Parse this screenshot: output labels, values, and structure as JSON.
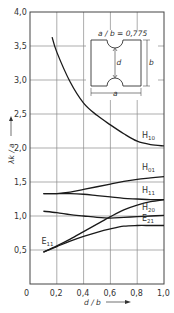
{
  "chart_data": {
    "type": "line",
    "title": "",
    "xlabel": "d / b",
    "ylabel": "λk / a",
    "xlim": [
      0,
      1.0
    ],
    "ylim": [
      0,
      4.0
    ],
    "grid": true,
    "x_ticks": [
      "0",
      "0,2",
      "0,4",
      "0,6",
      "0,8",
      "1,0"
    ],
    "y_ticks": [
      "0,5",
      "1,0",
      "1,5",
      "2,0",
      "2,5",
      "3,0",
      "3,5",
      "4,0"
    ],
    "y_zero_label": "0",
    "legend_position": "inline labels at right end of curves",
    "inset": {
      "label": "a / b = 0,775",
      "dim_width": "a",
      "dim_height": "b",
      "dim_gap": "d"
    },
    "series": [
      {
        "name": "H10",
        "label_main": "H",
        "label_sub": "10",
        "x": [
          0.165,
          0.2,
          0.3,
          0.4,
          0.5,
          0.6,
          0.7,
          0.8,
          0.9,
          1.0
        ],
        "y": [
          3.63,
          3.41,
          2.97,
          2.66,
          2.48,
          2.34,
          2.21,
          2.1,
          2.05,
          2.03
        ]
      },
      {
        "name": "H01",
        "label_main": "H",
        "label_sub": "01",
        "x": [
          0.1,
          0.2,
          0.3,
          0.4,
          0.5,
          0.6,
          0.7,
          0.8,
          0.9,
          1.0
        ],
        "y": [
          1.33,
          1.33,
          1.35,
          1.39,
          1.43,
          1.47,
          1.51,
          1.54,
          1.56,
          1.58
        ]
      },
      {
        "name": "H11",
        "label_main": "H",
        "label_sub": "11",
        "x": [
          0.1,
          0.2,
          0.3,
          0.4,
          0.5,
          0.6,
          0.7,
          0.8,
          0.9,
          1.0
        ],
        "y": [
          1.33,
          1.33,
          1.33,
          1.32,
          1.3,
          1.28,
          1.26,
          1.25,
          1.24,
          1.24
        ]
      },
      {
        "name": "H20",
        "label_main": "H",
        "label_sub": "20",
        "x": [
          0.1,
          0.2,
          0.3,
          0.4,
          0.5,
          0.6,
          0.7,
          0.8,
          0.9,
          1.0
        ],
        "y": [
          1.07,
          1.05,
          1.02,
          1.0,
          0.98,
          0.97,
          0.98,
          0.99,
          1.0,
          1.01
        ]
      },
      {
        "name": "E11 (upper branch)",
        "label_main": "",
        "label_sub": "",
        "x": [
          0.1,
          0.2,
          0.3,
          0.4,
          0.5,
          0.6,
          0.7,
          0.8,
          0.9,
          1.0
        ],
        "y": [
          0.47,
          0.56,
          0.66,
          0.77,
          0.88,
          0.99,
          1.09,
          1.16,
          1.21,
          1.24
        ]
      },
      {
        "name": "E21",
        "label_main": "E",
        "label_sub": "21",
        "x": [
          0.1,
          0.2,
          0.3,
          0.4,
          0.5,
          0.6,
          0.7,
          0.8,
          0.9,
          1.0
        ],
        "y": [
          0.47,
          0.55,
          0.63,
          0.7,
          0.76,
          0.81,
          0.85,
          0.86,
          0.86,
          0.86
        ]
      }
    ],
    "annotations": [
      {
        "text_main": "E",
        "text_sub": "11",
        "at": [
          0.1,
          0.47
        ]
      }
    ]
  }
}
